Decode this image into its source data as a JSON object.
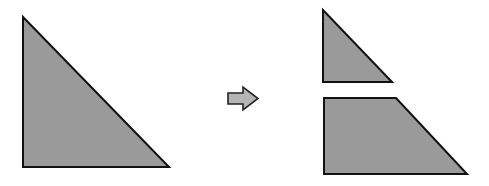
{
  "diagram": {
    "title": "Right triangle cut into a smaller triangle and a trapezoid",
    "colors": {
      "fill": "#9a9a9a",
      "stroke": "#111111",
      "arrow_fill": "#b5b5b5",
      "background": "#ffffff"
    },
    "shapes": {
      "original_triangle": {
        "label": "Original right triangle",
        "points": "23,17 23,167 169,167"
      },
      "arrow": {
        "label": "Transformation arrow",
        "points": "228,93 243,93 243,87 258,98.5 243,110 243,104 228,104"
      },
      "small_triangle": {
        "label": "Top piece: small right triangle",
        "points": "323,10 323,82 392,82"
      },
      "trapezoid": {
        "label": "Bottom piece: right trapezoid",
        "points": "324,98 396,98 467,174 324,174"
      }
    }
  }
}
